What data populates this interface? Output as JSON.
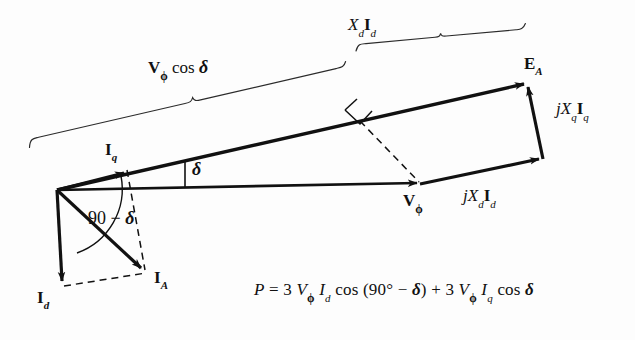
{
  "figure": {
    "type": "phasor-diagram",
    "background_color": "#fdfdfd",
    "line_color": "#111111"
  },
  "labels": {
    "xd_id": {
      "pre": "X",
      "pre_sub": "d",
      "main": "I",
      "main_sub": "d"
    },
    "vphi_cos_delta": {
      "main": "V",
      "main_sub": "ϕ",
      "rest": "cos",
      "delta": "δ"
    },
    "e_a": {
      "main": "E",
      "main_sub": "A"
    },
    "jxq_iq": {
      "j": "j",
      "x": "X",
      "x_sub": "q",
      "i": "I",
      "i_sub": "q"
    },
    "jxd_id": {
      "j": "j",
      "x": "X",
      "x_sub": "d",
      "i": "I",
      "i_sub": "d"
    },
    "i_q": {
      "main": "I",
      "main_sub": "q"
    },
    "i_d": {
      "main": "I",
      "main_sub": "d"
    },
    "i_a": {
      "main": "I",
      "main_sub": "A"
    },
    "v_phi": {
      "main": "V",
      "main_sub": "ϕ"
    },
    "delta_angle": "δ",
    "ninety_minus_delta": {
      "number": "90",
      "minus": "−",
      "delta": "δ"
    }
  },
  "equation": {
    "lhs": "P",
    "equals": "=",
    "term1": {
      "coef": "3",
      "v": "V",
      "v_sub": "ϕ",
      "i": "I",
      "i_sub": "d",
      "fn": "cos",
      "open": "(",
      "angle": "90°",
      "minus": "−",
      "delta": "δ",
      "close": ")"
    },
    "plus": "+",
    "term2": {
      "coef": "3",
      "v": "V",
      "v_sub": "ϕ",
      "i": "I",
      "i_sub": "q",
      "fn": "cos",
      "delta": "δ"
    },
    "full_text": "P = 3 Vϕ Id cos (90° − δ) + 3 Vϕ Iq cos δ"
  },
  "vectors": [
    {
      "name": "E_A",
      "from": [
        57,
        190
      ],
      "to": [
        527,
        83
      ],
      "style": "solid-thick-arrow"
    },
    {
      "name": "V_phi",
      "from": [
        57,
        190
      ],
      "to": [
        420,
        183
      ],
      "style": "solid-thick-arrow"
    },
    {
      "name": "I_q",
      "from": [
        57,
        190
      ],
      "to": [
        128,
        172
      ],
      "style": "solid-thick-arrow"
    },
    {
      "name": "I_A",
      "from": [
        57,
        190
      ],
      "to": [
        145,
        272
      ],
      "style": "solid-thick-arrow"
    },
    {
      "name": "I_d",
      "from": [
        57,
        190
      ],
      "to": [
        62,
        285
      ],
      "style": "solid-thick-arrow"
    },
    {
      "name": "jX_d_I_d",
      "from": [
        420,
        183
      ],
      "to": [
        542,
        158
      ],
      "style": "solid-thick-arrow"
    },
    {
      "name": "jX_q_I_q",
      "from": [
        542,
        158
      ],
      "to": [
        527,
        83
      ],
      "style": "solid-thick-arrow"
    }
  ],
  "dashed_lines": [
    {
      "name": "perpendicular-drop",
      "from": [
        358,
        118
      ],
      "to": [
        420,
        183
      ]
    },
    {
      "name": "iq-to-ia",
      "from": [
        128,
        172
      ],
      "to": [
        145,
        272
      ]
    },
    {
      "name": "id-to-ia",
      "from": [
        62,
        285
      ],
      "to": [
        145,
        272
      ]
    }
  ],
  "markers": {
    "right_angle": {
      "at": [
        358,
        118
      ],
      "name": "right-angle-marker"
    },
    "delta_arc": {
      "name": "delta-angle-marker"
    },
    "ninety_minus_delta_arc": {
      "name": "ninety-minus-delta-angle-arc"
    }
  },
  "braces": [
    {
      "name": "xd-id-brace",
      "from": [
        355,
        48
      ],
      "to": [
        525,
        32
      ]
    },
    {
      "name": "vphi-cos-delta-brace",
      "from": [
        30,
        145
      ],
      "to": [
        345,
        72
      ]
    }
  ]
}
